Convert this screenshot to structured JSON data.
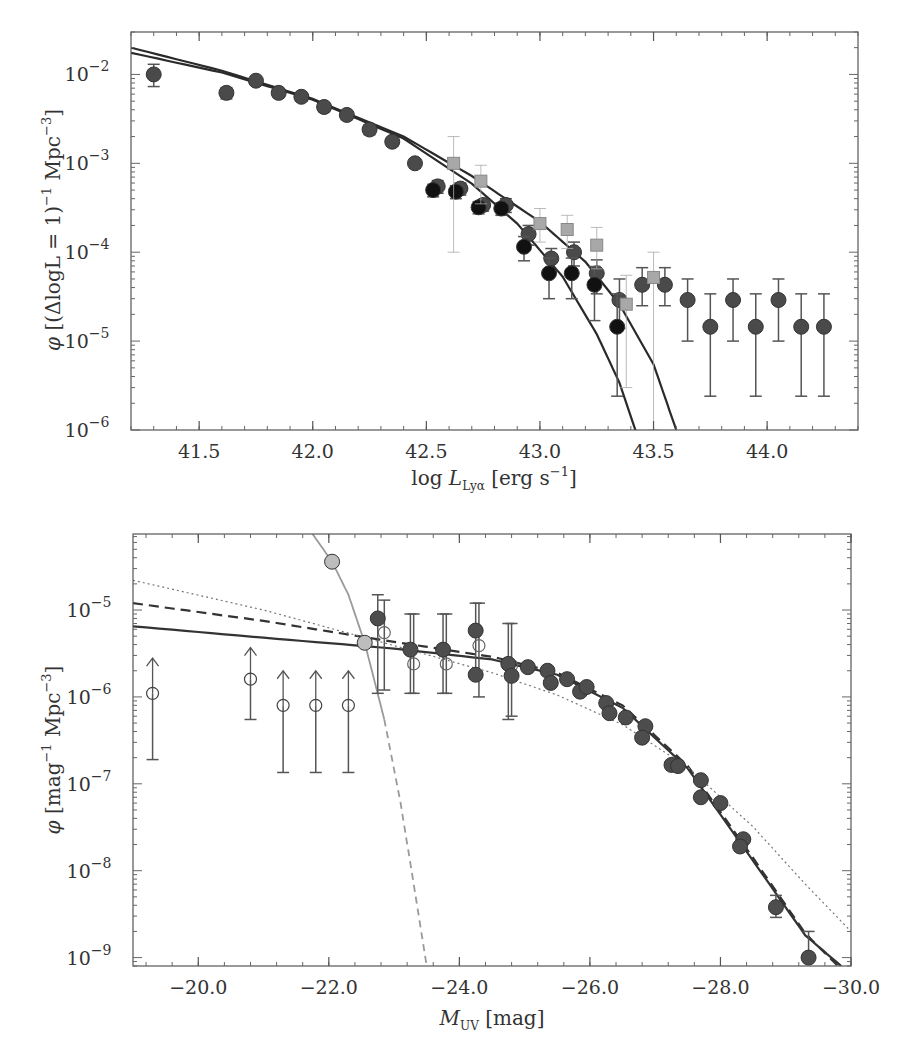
{
  "chart_data": [
    {
      "id": "lya_lf",
      "type": "scatter",
      "title": "",
      "xlabel": "log L_Lyα [erg s^-1]",
      "ylabel": "φ [(ΔlogL = 1)^-1 Mpc^-3]",
      "xscale": "linear",
      "yscale": "log",
      "xlim": [
        41.2,
        44.4
      ],
      "ylim": [
        1e-06,
        0.03
      ],
      "xticks": [
        "41.5",
        "42.0",
        "42.5",
        "43.0",
        "43.5",
        "44.0"
      ],
      "xtick_values": [
        41.5,
        42.0,
        42.5,
        43.0,
        43.5,
        44.0
      ],
      "yticks": [
        "10^-2",
        "10^-3",
        "10^-4",
        "10^-5",
        "10^-6"
      ],
      "ytick_exponents": [
        -2,
        -3,
        -4,
        -5,
        -6
      ],
      "grid": false,
      "legend": null,
      "series": [
        {
          "name": "dark grey circles (main sample)",
          "marker": "circle",
          "color": "#4a4a4a",
          "points": [
            {
              "x": 41.3,
              "y": 0.01,
              "lo": 0.0073,
              "hi": 0.013
            },
            {
              "x": 41.62,
              "y": 0.0062,
              "lo": 0.0053,
              "hi": 0.0071
            },
            {
              "x": 41.75,
              "y": 0.0085,
              "lo": 0.0076,
              "hi": 0.0094
            },
            {
              "x": 41.85,
              "y": 0.0062,
              "lo": 0.0055,
              "hi": 0.0069
            },
            {
              "x": 41.95,
              "y": 0.0056,
              "lo": 0.005,
              "hi": 0.0062
            },
            {
              "x": 42.05,
              "y": 0.0043,
              "lo": 0.0038,
              "hi": 0.0048
            },
            {
              "x": 42.15,
              "y": 0.0035,
              "lo": 0.0031,
              "hi": 0.0039
            },
            {
              "x": 42.25,
              "y": 0.0024,
              "lo": 0.0021,
              "hi": 0.0027
            },
            {
              "x": 42.35,
              "y": 0.00175,
              "lo": 0.00155,
              "hi": 0.00195
            },
            {
              "x": 42.45,
              "y": 0.001,
              "lo": 0.00088,
              "hi": 0.00112
            },
            {
              "x": 42.55,
              "y": 0.00055,
              "lo": 0.00046,
              "hi": 0.00064
            },
            {
              "x": 42.65,
              "y": 0.00052,
              "lo": 0.00044,
              "hi": 0.0006
            },
            {
              "x": 42.75,
              "y": 0.00034,
              "lo": 0.00029,
              "hi": 0.00039
            },
            {
              "x": 42.85,
              "y": 0.00034,
              "lo": 0.00028,
              "hi": 0.0004
            },
            {
              "x": 42.95,
              "y": 0.00016,
              "lo": 0.00012,
              "hi": 0.0002
            },
            {
              "x": 43.05,
              "y": 8.5e-05,
              "lo": 6e-05,
              "hi": 0.00011
            },
            {
              "x": 43.15,
              "y": 0.0001,
              "lo": 7e-05,
              "hi": 0.00013
            },
            {
              "x": 43.25,
              "y": 5.8e-05,
              "lo": 3.4e-05,
              "hi": 8.2e-05
            },
            {
              "x": 43.35,
              "y": 2.9e-05,
              "lo": 1.4e-05,
              "hi": 5e-05
            },
            {
              "x": 43.45,
              "y": 4.3e-05,
              "lo": 2.5e-05,
              "hi": 6.7e-05
            },
            {
              "x": 43.55,
              "y": 4.3e-05,
              "lo": 2.5e-05,
              "hi": 6.7e-05
            },
            {
              "x": 43.65,
              "y": 2.9e-05,
              "lo": 1e-05,
              "hi": 5e-05
            },
            {
              "x": 43.75,
              "y": 1.45e-05,
              "lo": 2.4e-06,
              "hi": 3.4e-05
            },
            {
              "x": 43.85,
              "y": 2.9e-05,
              "lo": 1e-05,
              "hi": 5e-05
            },
            {
              "x": 43.95,
              "y": 1.45e-05,
              "lo": 2.4e-06,
              "hi": 3.4e-05
            },
            {
              "x": 44.05,
              "y": 2.9e-05,
              "lo": 1e-05,
              "hi": 5e-05
            },
            {
              "x": 44.15,
              "y": 1.45e-05,
              "lo": 2.4e-06,
              "hi": 3.4e-05
            },
            {
              "x": 44.25,
              "y": 1.45e-05,
              "lo": 2.4e-06,
              "hi": 3.4e-05
            }
          ]
        },
        {
          "name": "black circles (secondary sample)",
          "marker": "circle",
          "color": "#111111",
          "points": [
            {
              "x": 42.53,
              "y": 0.0005,
              "lo": 0.00042,
              "hi": 0.00058
            },
            {
              "x": 42.63,
              "y": 0.00048,
              "lo": 0.0004,
              "hi": 0.00056
            },
            {
              "x": 42.73,
              "y": 0.00032,
              "lo": 0.00027,
              "hi": 0.00037
            },
            {
              "x": 42.83,
              "y": 0.00031,
              "lo": 0.00026,
              "hi": 0.00036
            },
            {
              "x": 42.93,
              "y": 0.000115,
              "lo": 8e-05,
              "hi": 0.00015
            },
            {
              "x": 43.04,
              "y": 5.8e-05,
              "lo": 3e-05,
              "hi": 8.6e-05
            },
            {
              "x": 43.14,
              "y": 5.8e-05,
              "lo": 3e-05,
              "hi": 8.6e-05
            },
            {
              "x": 43.24,
              "y": 4.3e-05,
              "lo": 1.7e-05,
              "hi": 6.9e-05
            },
            {
              "x": 43.34,
              "y": 1.45e-05,
              "lo": 2.4e-06,
              "hi": 3.4e-05
            }
          ]
        },
        {
          "name": "light grey squares (literature)",
          "marker": "square",
          "color": "#a8a8a8",
          "points": [
            {
              "x": 42.62,
              "y": 0.001,
              "lo": 0.0001,
              "hi": 0.002
            },
            {
              "x": 42.74,
              "y": 0.00063,
              "lo": 0.00035,
              "hi": 0.00095
            },
            {
              "x": 43.0,
              "y": 0.00021,
              "lo": 0.00013,
              "hi": 0.00031
            },
            {
              "x": 43.12,
              "y": 0.00018,
              "lo": 0.00011,
              "hi": 0.00026
            },
            {
              "x": 43.25,
              "y": 0.00012,
              "lo": 6.5e-05,
              "hi": 0.00019
            },
            {
              "x": 43.38,
              "y": 2.6e-05,
              "lo": 3e-06,
              "hi": 5.5e-05
            },
            {
              "x": 43.5,
              "y": 5.2e-05,
              "lo": 1e-06,
              "hi": 0.0001
            }
          ]
        }
      ],
      "curves": [
        {
          "name": "Schechter fit 1 (steeper)",
          "style": "solid",
          "color": "#2a2a2a",
          "points": [
            [
              41.2,
              0.0175
            ],
            [
              41.6,
              0.0105
            ],
            [
              42.0,
              0.0052
            ],
            [
              42.4,
              0.0019
            ],
            [
              42.7,
              0.00059
            ],
            [
              42.9,
              0.00021
            ],
            [
              43.1,
              5.3e-05
            ],
            [
              43.25,
              1.2e-05
            ],
            [
              43.35,
              3.4e-06
            ],
            [
              43.42,
              1e-06
            ]
          ]
        },
        {
          "name": "Schechter fit 2 (shallower)",
          "style": "solid",
          "color": "#2a2a2a",
          "points": [
            [
              41.2,
              0.02
            ],
            [
              41.6,
              0.011
            ],
            [
              42.0,
              0.0053
            ],
            [
              42.4,
              0.002
            ],
            [
              42.7,
              0.00072
            ],
            [
              43.0,
              0.00022
            ],
            [
              43.2,
              7.8e-05
            ],
            [
              43.35,
              2.6e-05
            ],
            [
              43.5,
              5.5e-06
            ],
            [
              43.6,
              1e-06
            ]
          ]
        }
      ]
    },
    {
      "id": "uv_lf",
      "type": "scatter",
      "title": "",
      "xlabel": "M_UV [mag]",
      "ylabel": "φ [mag^-1 Mpc^-3]",
      "xscale": "linear",
      "yscale": "log",
      "xlim": [
        -19.0,
        -30.0
      ],
      "ylim": [
        8e-10,
        7.5e-05
      ],
      "xticks": [
        "−20.0",
        "−22.0",
        "−24.0",
        "−26.0",
        "−28.0",
        "−30.0"
      ],
      "xtick_values": [
        -20.0,
        -22.0,
        -24.0,
        -26.0,
        -28.0,
        -30.0
      ],
      "yticks": [
        "10^-5",
        "10^-6",
        "10^-7",
        "10^-8",
        "10^-9"
      ],
      "ytick_exponents": [
        -5,
        -6,
        -7,
        -8,
        -9
      ],
      "grid": false,
      "legend": null,
      "series": [
        {
          "name": "open circles (lower limits)",
          "marker": "open-circle",
          "color": "#444444",
          "lower_limit": true,
          "points": [
            {
              "x": -19.3,
              "y": 1.1e-06,
              "lo": 1.9e-07,
              "arrow_to": 2.8e-06
            },
            {
              "x": -20.8,
              "y": 1.6e-06,
              "lo": 5.5e-07,
              "arrow_to": 3.7e-06
            },
            {
              "x": -21.3,
              "y": 8e-07,
              "lo": 1.35e-07,
              "arrow_to": 2e-06
            },
            {
              "x": -21.8,
              "y": 8e-07,
              "lo": 1.35e-07,
              "arrow_to": 2e-06
            },
            {
              "x": -22.3,
              "y": 8e-07,
              "lo": 1.35e-07,
              "arrow_to": 2e-06
            }
          ]
        },
        {
          "name": "light grey circles (faint-end component)",
          "marker": "circle",
          "color": "#bdbdbd",
          "points": [
            {
              "x": -22.05,
              "y": 3.6e-05
            },
            {
              "x": -22.55,
              "y": 4.2e-06
            }
          ]
        },
        {
          "name": "open circles / squares (literature)",
          "marker": "open-circle",
          "color": "#666666",
          "points": [
            {
              "x": -22.85,
              "y": 5.5e-06,
              "lo": 1.2e-06,
              "hi": 1.3e-05
            },
            {
              "x": -23.3,
              "y": 2.4e-06,
              "lo": 1.1e-06,
              "hi": 9e-06
            },
            {
              "x": -23.8,
              "y": 2.4e-06,
              "lo": 1.1e-06,
              "hi": 9e-06
            },
            {
              "x": -24.3,
              "y": 3.9e-06,
              "lo": 1e-06,
              "hi": 1.2e-05
            },
            {
              "x": -24.8,
              "y": 2.3e-06,
              "lo": 6e-07,
              "hi": 7e-06
            }
          ]
        },
        {
          "name": "dark grey circles (this work)",
          "marker": "circle",
          "color": "#4d4d4d",
          "points": [
            {
              "x": -22.75,
              "y": 8e-06,
              "lo": 1.1e-06,
              "hi": 1.5e-05
            },
            {
              "x": -23.25,
              "y": 3.5e-06,
              "lo": 1.1e-06,
              "hi": 9e-06
            },
            {
              "x": -23.75,
              "y": 3.5e-06,
              "lo": 1.1e-06,
              "hi": 9e-06
            },
            {
              "x": -24.25,
              "y": 5.8e-06,
              "lo": 1.8e-06,
              "hi": 1.2e-05
            },
            {
              "x": -24.25,
              "y": 1.8e-06
            },
            {
              "x": -24.75,
              "y": 2.4e-06,
              "lo": 5.5e-07,
              "hi": 7e-06
            },
            {
              "x": -24.8,
              "y": 1.75e-06
            },
            {
              "x": -25.05,
              "y": 2.2e-06
            },
            {
              "x": -25.35,
              "y": 2e-06
            },
            {
              "x": -25.4,
              "y": 1.45e-06
            },
            {
              "x": -25.65,
              "y": 1.6e-06
            },
            {
              "x": -25.85,
              "y": 1.15e-06
            },
            {
              "x": -25.95,
              "y": 1.3e-06
            },
            {
              "x": -26.25,
              "y": 8.5e-07
            },
            {
              "x": -26.3,
              "y": 6.5e-07
            },
            {
              "x": -26.55,
              "y": 5.8e-07
            },
            {
              "x": -26.85,
              "y": 4.6e-07
            },
            {
              "x": -26.8,
              "y": 3.4e-07
            },
            {
              "x": -27.25,
              "y": 1.65e-07
            },
            {
              "x": -27.35,
              "y": 1.6e-07
            },
            {
              "x": -27.7,
              "y": 1.1e-07
            },
            {
              "x": -27.7,
              "y": 7e-08
            },
            {
              "x": -28.0,
              "y": 6e-08
            },
            {
              "x": -28.35,
              "y": 2.3e-08
            },
            {
              "x": -28.3,
              "y": 1.9e-08
            },
            {
              "x": -28.85,
              "y": 3.8e-09,
              "lo": 2.9e-09,
              "hi": 5.2e-09
            },
            {
              "x": -29.35,
              "y": 1e-09,
              "hi": 2e-09
            }
          ]
        }
      ],
      "curves": [
        {
          "name": "best fit (solid)",
          "style": "solid",
          "color": "#333333",
          "points": [
            [
              -19.0,
              6.5e-06
            ],
            [
              -21.0,
              4.8e-06
            ],
            [
              -23.0,
              3.6e-06
            ],
            [
              -24.5,
              2.7e-06
            ],
            [
              -25.5,
              1.8e-06
            ],
            [
              -26.5,
              7.5e-07
            ],
            [
              -27.5,
              1.5e-07
            ],
            [
              -28.5,
              1.3e-08
            ],
            [
              -29.3,
              1.8e-09
            ],
            [
              -29.85,
              8e-10
            ]
          ]
        },
        {
          "name": "alternate fit (dashed)",
          "style": "dashed",
          "color": "#333333",
          "points": [
            [
              -19.0,
              1.2e-05
            ],
            [
              -21.0,
              7.5e-06
            ],
            [
              -23.0,
              4.3e-06
            ],
            [
              -24.5,
              2.9e-06
            ],
            [
              -25.5,
              1.9e-06
            ],
            [
              -26.5,
              8e-07
            ],
            [
              -27.5,
              1.6e-07
            ],
            [
              -28.5,
              1.4e-08
            ],
            [
              -29.3,
              1.9e-09
            ],
            [
              -29.8,
              8e-10
            ]
          ]
        },
        {
          "name": "double power law (dotted)",
          "style": "dotted",
          "color": "#777777",
          "points": [
            [
              -19.0,
              2.2e-05
            ],
            [
              -21.0,
              1e-05
            ],
            [
              -23.0,
              3.9e-06
            ],
            [
              -24.5,
              1.9e-06
            ],
            [
              -25.5,
              1.05e-06
            ],
            [
              -26.5,
              4.8e-07
            ],
            [
              -27.5,
              1.55e-07
            ],
            [
              -28.5,
              3.2e-08
            ],
            [
              -29.3,
              7e-09
            ],
            [
              -30.0,
              2e-09
            ]
          ]
        },
        {
          "name": "faint-end component (grey solid→dashed)",
          "style": "grey",
          "color": "#9a9a9a",
          "points": [
            [
              -21.75,
              7.5e-05
            ],
            [
              -22.05,
              3.6e-05
            ],
            [
              -22.3,
              1.5e-05
            ],
            [
              -22.55,
              4.2e-06
            ],
            [
              -22.85,
              5.5e-07
            ],
            [
              -23.1,
              6e-08
            ],
            [
              -23.3,
              7e-09
            ],
            [
              -23.5,
              8e-10
            ]
          ],
          "dashed_after_x": -22.85
        }
      ]
    }
  ],
  "charts": {
    "top": {
      "xticks": [
        "41.5",
        "42.0",
        "42.5",
        "43.0",
        "43.5",
        "44.0"
      ],
      "ytick_base": "10",
      "ytick_exps": [
        "−2",
        "−3",
        "−4",
        "−5",
        "−6"
      ],
      "xlabel_main": "log ",
      "xlabel_L": "L",
      "xlabel_sub": "Lyα",
      "xlabel_unit": " [erg s",
      "xlabel_unit_exp": "−1",
      "xlabel_close": "]",
      "ylabel_phi": "φ",
      "ylabel_text": " [(ΔlogL = 1)",
      "ylabel_exp1": "−1",
      "ylabel_mid": " Mpc",
      "ylabel_exp2": "−3",
      "ylabel_close": "]"
    },
    "bottom": {
      "xticks": [
        "−20.0",
        "−22.0",
        "−24.0",
        "−26.0",
        "−28.0",
        "−30.0"
      ],
      "ytick_base": "10",
      "ytick_exps": [
        "−5",
        "−6",
        "−7",
        "−8",
        "−9"
      ],
      "xlabel_M": "M",
      "xlabel_sub": "UV",
      "xlabel_unit": " [mag]",
      "ylabel_phi": "φ",
      "ylabel_text": " [mag",
      "ylabel_exp1": "−1",
      "ylabel_mid": " Mpc",
      "ylabel_exp2": "−3",
      "ylabel_close": "]"
    }
  }
}
